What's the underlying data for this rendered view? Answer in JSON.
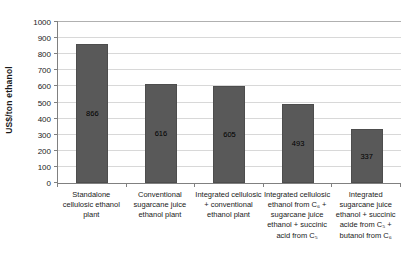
{
  "chart_data": {
    "type": "bar",
    "title": "",
    "ylabel": "US$/ton ethanol",
    "xlabel": "",
    "ylim": [
      0,
      1000
    ],
    "ytick_step": 100,
    "grid": true,
    "legend": "none",
    "bar_color": "#595959",
    "value_label_color": "#000000",
    "categories": [
      "Standalone cellulosic ethanol plant",
      "Conventional sugarcane juice ethanol plant",
      "Integrated cellulosic + conventional ethanol plant",
      "Integrated cellulosic ethanol from C₆ + sugarcane juice ethanol + succinic acid from C₅",
      "Integrated sugarcane juice ethanol + succinic acide from C₅ + butanol from C₆"
    ],
    "values": [
      866,
      616,
      605,
      493,
      337
    ],
    "value_labels": [
      "866",
      "616",
      "605",
      "493",
      "337"
    ]
  }
}
